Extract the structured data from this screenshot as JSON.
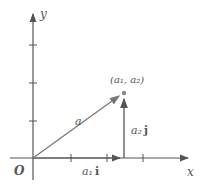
{
  "diagram": {
    "axes": {
      "x_label": "x",
      "y_label": "y",
      "origin_label": "O"
    },
    "point_label": "(a₁, a₂)",
    "vector_label": "a",
    "i_component_label": "a₁",
    "i_unit": "i",
    "j_component_label": "a₂",
    "j_unit": "j",
    "colors": {
      "axis": "#444444",
      "vector": "#777777",
      "point": "#888888",
      "text": "#555555"
    }
  }
}
